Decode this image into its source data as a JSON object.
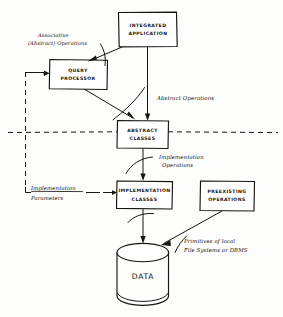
{
  "diagram": {
    "ink_color": "#16150f",
    "background_color": "#fdfdfc",
    "nodes": [
      {
        "id": "integrated-application",
        "shape": "rectangle",
        "line1": "INTEGRATED",
        "line2": "APPLICATION"
      },
      {
        "id": "query-processor",
        "shape": "rectangle",
        "line1": "QUERY",
        "line2": "PROCESSOR"
      },
      {
        "id": "abstract-classes",
        "shape": "rectangle",
        "line1": "ABSTRACT",
        "line2": "CLASSES"
      },
      {
        "id": "implementation-classes",
        "shape": "rectangle",
        "line1": "IMPLEMENTATION",
        "line2": "CLASSES"
      },
      {
        "id": "preexisting-operations",
        "shape": "rectangle",
        "line1": "PREEXISTING",
        "line2": "OPERATIONS"
      },
      {
        "id": "data-store",
        "shape": "cylinder",
        "line1": "DATA",
        "line2": ""
      }
    ],
    "edge_labels": [
      {
        "id": "associative-abstract-operations",
        "line1": "Associative",
        "line2": "(Abstract) Operations"
      },
      {
        "id": "abstract-operations",
        "line1": "Abstract Operations",
        "line2": ""
      },
      {
        "id": "implementation-operations",
        "line1": "Implementation",
        "line2": "Operations"
      },
      {
        "id": "implementation-parameters",
        "line1": "Implementation",
        "line2": "Parameters"
      },
      {
        "id": "primitives-local-file-systems",
        "line1": "Primitives of local",
        "line2": "File Systems or DBMS"
      }
    ]
  }
}
